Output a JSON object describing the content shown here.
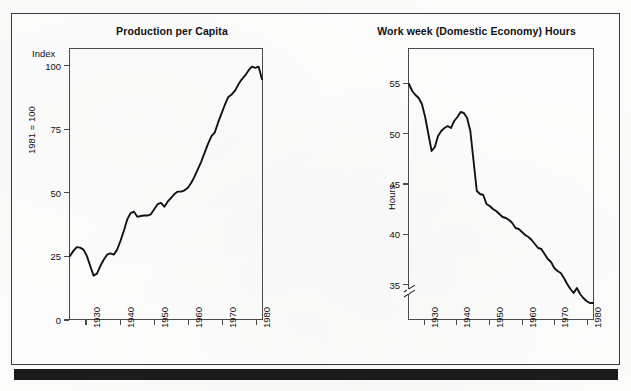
{
  "page": {
    "background_color": "#fbfbfa",
    "frame_color": "#3a3a3a",
    "rule_color": "#1b1b1b",
    "line_color": "#111111"
  },
  "chart_data": [
    {
      "id": "production-per-capita",
      "type": "line",
      "title": "Production per Capita",
      "xlabel": "",
      "ylabel": "Index",
      "y_unit_label": "1981 = 100",
      "xlim": [
        1925,
        1982
      ],
      "ylim": [
        0,
        107
      ],
      "yticks": [
        0,
        25,
        50,
        75,
        100
      ],
      "ytick_labels": [
        "0",
        "25",
        "50",
        "75",
        "100"
      ],
      "xticks": [
        1930,
        1940,
        1950,
        1960,
        1970,
        1980
      ],
      "xtick_labels": [
        "1930",
        "1940",
        "1950",
        "1960",
        "1970",
        "1980"
      ],
      "grid": false,
      "legend": "none",
      "axis_break": false,
      "series": [
        {
          "name": "Production per Capita",
          "x": [
            1925,
            1926,
            1927,
            1928,
            1929,
            1930,
            1931,
            1932,
            1933,
            1934,
            1935,
            1936,
            1937,
            1938,
            1939,
            1940,
            1941,
            1942,
            1943,
            1944,
            1945,
            1946,
            1947,
            1948,
            1949,
            1950,
            1951,
            1952,
            1953,
            1954,
            1955,
            1956,
            1957,
            1958,
            1959,
            1960,
            1961,
            1962,
            1963,
            1964,
            1965,
            1966,
            1967,
            1968,
            1969,
            1970,
            1971,
            1972,
            1973,
            1974,
            1975,
            1976,
            1977,
            1978,
            1979,
            1980,
            1981,
            1982
          ],
          "y": [
            25.0,
            27.0,
            28.5,
            28.3,
            27.5,
            25.0,
            21.0,
            17.2,
            18.0,
            21.0,
            23.5,
            25.5,
            26.0,
            25.5,
            27.5,
            31.0,
            35.0,
            39.5,
            42.0,
            42.5,
            40.5,
            40.8,
            41.0,
            41.0,
            41.5,
            43.5,
            45.5,
            46.0,
            44.5,
            46.5,
            48.0,
            49.5,
            50.5,
            50.5,
            51.0,
            52.0,
            54.0,
            56.5,
            59.5,
            62.5,
            66.0,
            69.5,
            72.5,
            74.0,
            78.0,
            81.5,
            85.0,
            88.0,
            89.0,
            90.5,
            93.0,
            95.0,
            96.5,
            98.5,
            100.0,
            99.5,
            100.0,
            95.0
          ]
        }
      ]
    },
    {
      "id": "work-week-domestic-economy-hours",
      "type": "line",
      "title": "Work week (Domestic Economy) Hours",
      "xlabel": "",
      "ylabel": "Hours",
      "y_unit_label": "Hours",
      "xlim": [
        1925,
        1982
      ],
      "ylim": [
        31.5,
        58.5
      ],
      "yticks": [
        35,
        40,
        45,
        50,
        55
      ],
      "ytick_labels": [
        "35",
        "40",
        "45",
        "50",
        "55"
      ],
      "xticks": [
        1930,
        1940,
        1950,
        1960,
        1970,
        1980
      ],
      "xtick_labels": [
        "1930",
        "1940",
        "1950",
        "1960",
        "1970",
        "1980"
      ],
      "grid": false,
      "legend": "none",
      "axis_break": true,
      "axis_break_note": "double-slash break on y-axis below 35",
      "series": [
        {
          "name": "Work week hours",
          "x": [
            1925,
            1926,
            1927,
            1928,
            1929,
            1930,
            1931,
            1932,
            1933,
            1934,
            1935,
            1936,
            1937,
            1938,
            1939,
            1940,
            1941,
            1942,
            1943,
            1944,
            1945,
            1946,
            1947,
            1948,
            1949,
            1950,
            1951,
            1952,
            1953,
            1954,
            1955,
            1956,
            1957,
            1958,
            1959,
            1960,
            1961,
            1962,
            1963,
            1964,
            1965,
            1966,
            1967,
            1968,
            1969,
            1970,
            1971,
            1972,
            1973,
            1974,
            1975,
            1976,
            1977,
            1978,
            1979,
            1980,
            1981,
            1982
          ],
          "y": [
            55.0,
            54.3,
            53.9,
            53.6,
            53.0,
            51.7,
            50.0,
            48.3,
            48.7,
            49.8,
            50.3,
            50.6,
            50.8,
            50.6,
            51.3,
            51.7,
            52.2,
            52.1,
            51.6,
            50.3,
            47.3,
            44.3,
            44.0,
            43.9,
            43.0,
            42.8,
            42.5,
            42.3,
            42.0,
            41.7,
            41.6,
            41.4,
            41.1,
            40.6,
            40.5,
            40.2,
            39.9,
            39.7,
            39.4,
            39.0,
            38.6,
            38.5,
            38.0,
            37.5,
            37.2,
            36.6,
            36.3,
            36.1,
            35.6,
            35.0,
            34.5,
            34.1,
            34.6,
            34.0,
            33.6,
            33.3,
            33.1,
            33.1
          ]
        }
      ]
    }
  ]
}
